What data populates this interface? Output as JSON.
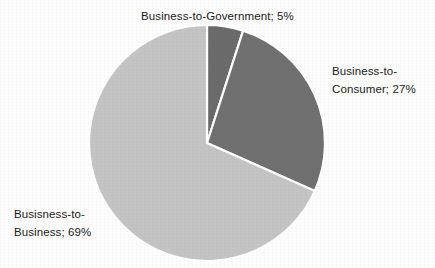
{
  "chart_data": {
    "type": "pie",
    "title": "",
    "subtitle": "",
    "xlabel": "",
    "ylabel": "",
    "legend_position": "none",
    "grid": false,
    "label_format": "name; percent",
    "categories": [
      "Business-to-Government",
      "Business-to-Consumer",
      "Busisness-to-Business"
    ],
    "values": [
      5,
      27,
      69
    ],
    "units": "%",
    "start_angle_deg": 0,
    "direction": "clockwise",
    "colors": [
      "#6b6b6b",
      "#707070",
      "#c4c4c4"
    ],
    "separator_color": "#ffffff",
    "slices": [
      {
        "name": "Business-to-Government",
        "value": 5,
        "value_text": "5%",
        "label_text": "Business-to-Government; 5%",
        "color": "#6b6b6b",
        "start_deg": 0,
        "end_deg": 18
      },
      {
        "name": "Business-to-Consumer",
        "value": 27,
        "value_text": "27%",
        "label_text": "Business-to-Consumer; 27%",
        "color": "#707070",
        "start_deg": 18,
        "end_deg": 115.2
      },
      {
        "name": "Busisness-to-Business",
        "value": 69,
        "value_text": "69%",
        "label_text": "Busisness-to-Business; 69%",
        "color": "#c4c4c4",
        "start_deg": 115.2,
        "end_deg": 360
      }
    ]
  },
  "labels": {
    "business_to_government": {
      "line1": "Business-to-Government; 5%"
    },
    "business_to_consumer": {
      "line1": "Business-to-",
      "line2": "Consumer; 27%"
    },
    "business_to_business": {
      "line1": "Busisness-to-",
      "line2": "Business; 69%"
    }
  }
}
